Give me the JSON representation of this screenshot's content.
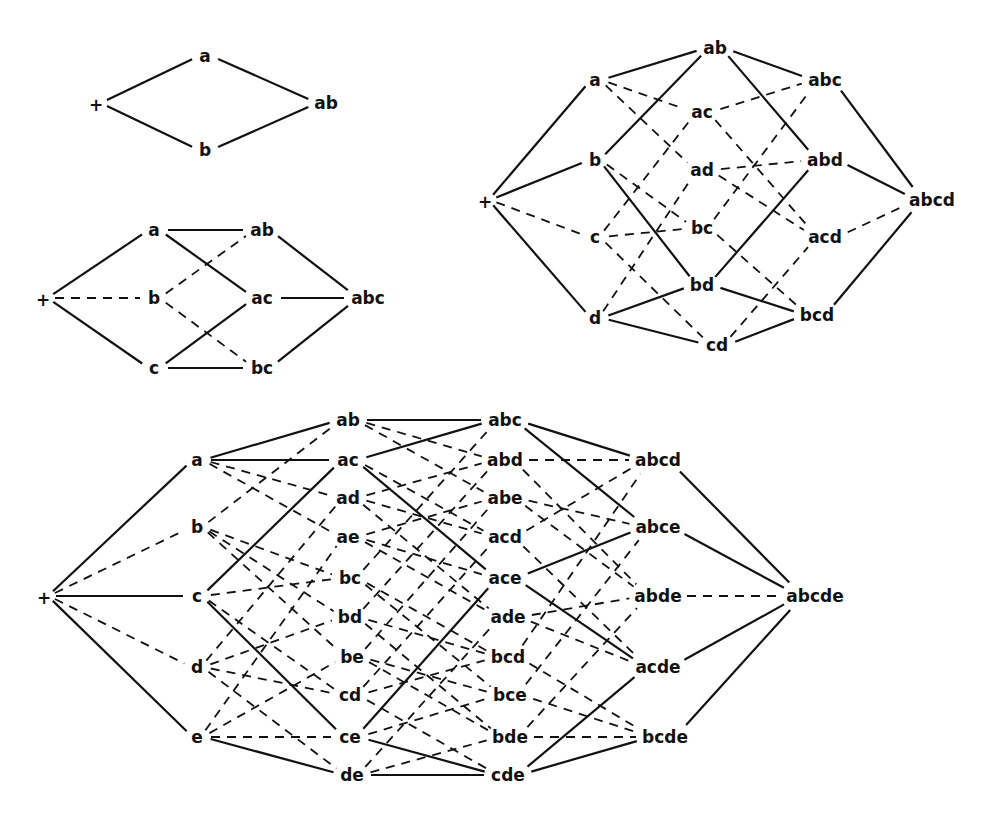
{
  "figure": {
    "title": "",
    "colors": {
      "ink": "#111111",
      "background": "#ffffff"
    }
  },
  "diagrams": [
    {
      "id": "lattice-2",
      "nodes": [
        {
          "id": "+",
          "label": "+",
          "x": 96,
          "y": 103
        },
        {
          "id": "a",
          "label": "a",
          "x": 205,
          "y": 56
        },
        {
          "id": "b",
          "label": "b",
          "x": 205,
          "y": 150
        },
        {
          "id": "ab",
          "label": "ab",
          "x": 326,
          "y": 103
        }
      ],
      "edges": [
        {
          "from": "+",
          "to": "a",
          "style": "solid"
        },
        {
          "from": "+",
          "to": "b",
          "style": "solid"
        },
        {
          "from": "a",
          "to": "ab",
          "style": "solid"
        },
        {
          "from": "b",
          "to": "ab",
          "style": "solid"
        }
      ]
    },
    {
      "id": "lattice-3",
      "nodes": [
        {
          "id": "+",
          "label": "+",
          "x": 43,
          "y": 298
        },
        {
          "id": "a",
          "label": "a",
          "x": 154,
          "y": 230
        },
        {
          "id": "b",
          "label": "b",
          "x": 154,
          "y": 298
        },
        {
          "id": "c",
          "label": "c",
          "x": 154,
          "y": 368
        },
        {
          "id": "ab",
          "label": "ab",
          "x": 262,
          "y": 230
        },
        {
          "id": "ac",
          "label": "ac",
          "x": 262,
          "y": 298
        },
        {
          "id": "bc",
          "label": "bc",
          "x": 262,
          "y": 368
        },
        {
          "id": "abc",
          "label": "abc",
          "x": 368,
          "y": 298
        }
      ],
      "edges": [
        {
          "from": "+",
          "to": "a",
          "style": "solid"
        },
        {
          "from": "+",
          "to": "b",
          "style": "dash"
        },
        {
          "from": "+",
          "to": "c",
          "style": "solid"
        },
        {
          "from": "a",
          "to": "ab",
          "style": "solid"
        },
        {
          "from": "a",
          "to": "ac",
          "style": "solid"
        },
        {
          "from": "b",
          "to": "ab",
          "style": "dash"
        },
        {
          "from": "b",
          "to": "bc",
          "style": "dash"
        },
        {
          "from": "c",
          "to": "ac",
          "style": "solid"
        },
        {
          "from": "c",
          "to": "bc",
          "style": "solid"
        },
        {
          "from": "ab",
          "to": "abc",
          "style": "solid"
        },
        {
          "from": "ac",
          "to": "abc",
          "style": "solid"
        },
        {
          "from": "bc",
          "to": "abc",
          "style": "solid"
        }
      ]
    },
    {
      "id": "lattice-4",
      "nodes": [
        {
          "id": "+",
          "label": "+",
          "x": 485,
          "y": 200
        },
        {
          "id": "a",
          "label": "a",
          "x": 595,
          "y": 80
        },
        {
          "id": "b",
          "label": "b",
          "x": 595,
          "y": 160
        },
        {
          "id": "c",
          "label": "c",
          "x": 595,
          "y": 237
        },
        {
          "id": "d",
          "label": "d",
          "x": 595,
          "y": 318
        },
        {
          "id": "ab",
          "label": "ab",
          "x": 715,
          "y": 48
        },
        {
          "id": "ac",
          "label": "ac",
          "x": 702,
          "y": 112
        },
        {
          "id": "ad",
          "label": "ad",
          "x": 702,
          "y": 170
        },
        {
          "id": "bc",
          "label": "bc",
          "x": 702,
          "y": 228
        },
        {
          "id": "bd",
          "label": "bd",
          "x": 702,
          "y": 285
        },
        {
          "id": "cd",
          "label": "cd",
          "x": 717,
          "y": 345
        },
        {
          "id": "abc",
          "label": "abc",
          "x": 825,
          "y": 80
        },
        {
          "id": "abd",
          "label": "abd",
          "x": 825,
          "y": 160
        },
        {
          "id": "acd",
          "label": "acd",
          "x": 825,
          "y": 237
        },
        {
          "id": "bcd",
          "label": "bcd",
          "x": 817,
          "y": 315
        },
        {
          "id": "abcd",
          "label": "abcd",
          "x": 932,
          "y": 200
        }
      ],
      "edges": [
        {
          "from": "+",
          "to": "a",
          "style": "solid"
        },
        {
          "from": "+",
          "to": "b",
          "style": "solid"
        },
        {
          "from": "+",
          "to": "c",
          "style": "dash"
        },
        {
          "from": "+",
          "to": "d",
          "style": "solid"
        },
        {
          "from": "a",
          "to": "ab",
          "style": "solid"
        },
        {
          "from": "a",
          "to": "ac",
          "style": "dash"
        },
        {
          "from": "a",
          "to": "ad",
          "style": "dash"
        },
        {
          "from": "b",
          "to": "ab",
          "style": "solid"
        },
        {
          "from": "b",
          "to": "bc",
          "style": "dash"
        },
        {
          "from": "b",
          "to": "bd",
          "style": "solid"
        },
        {
          "from": "c",
          "to": "ac",
          "style": "dash"
        },
        {
          "from": "c",
          "to": "bc",
          "style": "dash"
        },
        {
          "from": "c",
          "to": "cd",
          "style": "dash"
        },
        {
          "from": "d",
          "to": "ad",
          "style": "dash"
        },
        {
          "from": "d",
          "to": "bd",
          "style": "solid"
        },
        {
          "from": "d",
          "to": "cd",
          "style": "solid"
        },
        {
          "from": "ab",
          "to": "abc",
          "style": "solid"
        },
        {
          "from": "ab",
          "to": "abd",
          "style": "solid"
        },
        {
          "from": "ac",
          "to": "abc",
          "style": "dash"
        },
        {
          "from": "ac",
          "to": "acd",
          "style": "dash"
        },
        {
          "from": "ad",
          "to": "abd",
          "style": "dash"
        },
        {
          "from": "ad",
          "to": "acd",
          "style": "dash"
        },
        {
          "from": "bc",
          "to": "abc",
          "style": "dash"
        },
        {
          "from": "bc",
          "to": "bcd",
          "style": "dash"
        },
        {
          "from": "bd",
          "to": "abd",
          "style": "solid"
        },
        {
          "from": "bd",
          "to": "bcd",
          "style": "solid"
        },
        {
          "from": "cd",
          "to": "acd",
          "style": "dash"
        },
        {
          "from": "cd",
          "to": "bcd",
          "style": "solid"
        },
        {
          "from": "abc",
          "to": "abcd",
          "style": "solid"
        },
        {
          "from": "abd",
          "to": "abcd",
          "style": "solid"
        },
        {
          "from": "acd",
          "to": "abcd",
          "style": "dash"
        },
        {
          "from": "bcd",
          "to": "abcd",
          "style": "solid"
        }
      ]
    },
    {
      "id": "lattice-5",
      "nodes": [
        {
          "id": "+",
          "label": "+",
          "x": 44,
          "y": 596
        },
        {
          "id": "a",
          "label": "a",
          "x": 197,
          "y": 460
        },
        {
          "id": "b",
          "label": "b",
          "x": 197,
          "y": 527
        },
        {
          "id": "c",
          "label": "c",
          "x": 197,
          "y": 596
        },
        {
          "id": "d",
          "label": "d",
          "x": 197,
          "y": 667
        },
        {
          "id": "e",
          "label": "e",
          "x": 197,
          "y": 737
        },
        {
          "id": "ab",
          "label": "ab",
          "x": 348,
          "y": 420
        },
        {
          "id": "ac",
          "label": "ac",
          "x": 348,
          "y": 460
        },
        {
          "id": "ad",
          "label": "ad",
          "x": 348,
          "y": 498
        },
        {
          "id": "ae",
          "label": "ae",
          "x": 348,
          "y": 537
        },
        {
          "id": "bc",
          "label": "bc",
          "x": 350,
          "y": 578
        },
        {
          "id": "bd",
          "label": "bd",
          "x": 350,
          "y": 617
        },
        {
          "id": "be",
          "label": "be",
          "x": 352,
          "y": 657
        },
        {
          "id": "cd",
          "label": "cd",
          "x": 350,
          "y": 695
        },
        {
          "id": "ce",
          "label": "ce",
          "x": 350,
          "y": 737
        },
        {
          "id": "de",
          "label": "de",
          "x": 352,
          "y": 775
        },
        {
          "id": "abc",
          "label": "abc",
          "x": 505,
          "y": 420
        },
        {
          "id": "abd",
          "label": "abd",
          "x": 505,
          "y": 460
        },
        {
          "id": "abe",
          "label": "abe",
          "x": 505,
          "y": 498
        },
        {
          "id": "acd",
          "label": "acd",
          "x": 505,
          "y": 537
        },
        {
          "id": "ace",
          "label": "ace",
          "x": 505,
          "y": 578
        },
        {
          "id": "ade",
          "label": "ade",
          "x": 508,
          "y": 617
        },
        {
          "id": "bcd",
          "label": "bcd",
          "x": 508,
          "y": 657
        },
        {
          "id": "bce",
          "label": "bce",
          "x": 510,
          "y": 695
        },
        {
          "id": "bde",
          "label": "bde",
          "x": 510,
          "y": 737
        },
        {
          "id": "cde",
          "label": "cde",
          "x": 508,
          "y": 775
        },
        {
          "id": "abcd",
          "label": "abcd",
          "x": 658,
          "y": 460
        },
        {
          "id": "abce",
          "label": "abce",
          "x": 658,
          "y": 527
        },
        {
          "id": "abde",
          "label": "abde",
          "x": 658,
          "y": 596
        },
        {
          "id": "acde",
          "label": "acde",
          "x": 658,
          "y": 667
        },
        {
          "id": "bcde",
          "label": "bcde",
          "x": 665,
          "y": 737
        },
        {
          "id": "abcde",
          "label": "abcde",
          "x": 815,
          "y": 596
        }
      ],
      "edges": [
        {
          "from": "+",
          "to": "a",
          "style": "solid"
        },
        {
          "from": "+",
          "to": "b",
          "style": "dash"
        },
        {
          "from": "+",
          "to": "c",
          "style": "solid"
        },
        {
          "from": "+",
          "to": "d",
          "style": "dash"
        },
        {
          "from": "+",
          "to": "e",
          "style": "solid"
        },
        {
          "from": "a",
          "to": "ab",
          "style": "solid"
        },
        {
          "from": "a",
          "to": "ac",
          "style": "solid"
        },
        {
          "from": "a",
          "to": "ad",
          "style": "dash"
        },
        {
          "from": "a",
          "to": "ae",
          "style": "dash"
        },
        {
          "from": "b",
          "to": "ab",
          "style": "dash"
        },
        {
          "from": "b",
          "to": "bc",
          "style": "dash"
        },
        {
          "from": "b",
          "to": "bd",
          "style": "dash"
        },
        {
          "from": "b",
          "to": "be",
          "style": "dash"
        },
        {
          "from": "c",
          "to": "ac",
          "style": "solid"
        },
        {
          "from": "c",
          "to": "bc",
          "style": "dash"
        },
        {
          "from": "c",
          "to": "cd",
          "style": "dash"
        },
        {
          "from": "c",
          "to": "ce",
          "style": "solid"
        },
        {
          "from": "d",
          "to": "ad",
          "style": "dash"
        },
        {
          "from": "d",
          "to": "bd",
          "style": "dash"
        },
        {
          "from": "d",
          "to": "cd",
          "style": "dash"
        },
        {
          "from": "d",
          "to": "de",
          "style": "dash"
        },
        {
          "from": "e",
          "to": "ae",
          "style": "dash"
        },
        {
          "from": "e",
          "to": "be",
          "style": "dash"
        },
        {
          "from": "e",
          "to": "ce",
          "style": "dash"
        },
        {
          "from": "e",
          "to": "de",
          "style": "solid"
        },
        {
          "from": "ab",
          "to": "abc",
          "style": "solid"
        },
        {
          "from": "ab",
          "to": "abd",
          "style": "dash"
        },
        {
          "from": "ab",
          "to": "abe",
          "style": "dash"
        },
        {
          "from": "ac",
          "to": "abc",
          "style": "solid"
        },
        {
          "from": "ac",
          "to": "acd",
          "style": "dash"
        },
        {
          "from": "ac",
          "to": "ace",
          "style": "solid"
        },
        {
          "from": "ad",
          "to": "abd",
          "style": "dash"
        },
        {
          "from": "ad",
          "to": "acd",
          "style": "dash"
        },
        {
          "from": "ad",
          "to": "ade",
          "style": "dash"
        },
        {
          "from": "ae",
          "to": "abe",
          "style": "dash"
        },
        {
          "from": "ae",
          "to": "ace",
          "style": "dash"
        },
        {
          "from": "ae",
          "to": "ade",
          "style": "dash"
        },
        {
          "from": "bc",
          "to": "abc",
          "style": "dash"
        },
        {
          "from": "bc",
          "to": "bcd",
          "style": "dash"
        },
        {
          "from": "bc",
          "to": "bce",
          "style": "dash"
        },
        {
          "from": "bd",
          "to": "abd",
          "style": "dash"
        },
        {
          "from": "bd",
          "to": "bcd",
          "style": "dash"
        },
        {
          "from": "bd",
          "to": "bde",
          "style": "dash"
        },
        {
          "from": "be",
          "to": "abe",
          "style": "dash"
        },
        {
          "from": "be",
          "to": "bce",
          "style": "dash"
        },
        {
          "from": "be",
          "to": "bde",
          "style": "dash"
        },
        {
          "from": "cd",
          "to": "acd",
          "style": "dash"
        },
        {
          "from": "cd",
          "to": "bcd",
          "style": "dash"
        },
        {
          "from": "cd",
          "to": "cde",
          "style": "dash"
        },
        {
          "from": "ce",
          "to": "ace",
          "style": "solid"
        },
        {
          "from": "ce",
          "to": "bce",
          "style": "dash"
        },
        {
          "from": "ce",
          "to": "cde",
          "style": "solid"
        },
        {
          "from": "de",
          "to": "ade",
          "style": "dash"
        },
        {
          "from": "de",
          "to": "bde",
          "style": "dash"
        },
        {
          "from": "de",
          "to": "cde",
          "style": "solid"
        },
        {
          "from": "abc",
          "to": "abcd",
          "style": "solid"
        },
        {
          "from": "abc",
          "to": "abce",
          "style": "solid"
        },
        {
          "from": "abd",
          "to": "abcd",
          "style": "dash"
        },
        {
          "from": "abd",
          "to": "abde",
          "style": "dash"
        },
        {
          "from": "abe",
          "to": "abce",
          "style": "dash"
        },
        {
          "from": "abe",
          "to": "abde",
          "style": "dash"
        },
        {
          "from": "acd",
          "to": "abcd",
          "style": "dash"
        },
        {
          "from": "acd",
          "to": "acde",
          "style": "dash"
        },
        {
          "from": "ace",
          "to": "abce",
          "style": "solid"
        },
        {
          "from": "ace",
          "to": "acde",
          "style": "solid"
        },
        {
          "from": "ade",
          "to": "abde",
          "style": "dash"
        },
        {
          "from": "ade",
          "to": "acde",
          "style": "dash"
        },
        {
          "from": "bcd",
          "to": "abcd",
          "style": "dash"
        },
        {
          "from": "bcd",
          "to": "bcde",
          "style": "dash"
        },
        {
          "from": "bce",
          "to": "abce",
          "style": "dash"
        },
        {
          "from": "bce",
          "to": "bcde",
          "style": "dash"
        },
        {
          "from": "bde",
          "to": "abde",
          "style": "dash"
        },
        {
          "from": "bde",
          "to": "bcde",
          "style": "dash"
        },
        {
          "from": "cde",
          "to": "acde",
          "style": "solid"
        },
        {
          "from": "cde",
          "to": "bcde",
          "style": "solid"
        },
        {
          "from": "abcd",
          "to": "abcde",
          "style": "solid"
        },
        {
          "from": "abce",
          "to": "abcde",
          "style": "solid"
        },
        {
          "from": "abde",
          "to": "abcde",
          "style": "dash"
        },
        {
          "from": "acde",
          "to": "abcde",
          "style": "solid"
        },
        {
          "from": "bcde",
          "to": "abcde",
          "style": "solid"
        }
      ]
    }
  ]
}
